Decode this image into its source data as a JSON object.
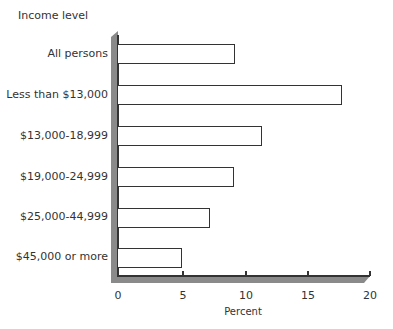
{
  "chart_data": {
    "type": "bar",
    "orientation": "horizontal",
    "title": "",
    "ylabel": "Income level",
    "xlabel": "Percent",
    "xlim": [
      0,
      20
    ],
    "xticks": [
      "0",
      "5",
      "10",
      "15",
      "20"
    ],
    "grid": false,
    "legend": null,
    "categories": [
      "All persons",
      "Less than $13,000",
      "$13,000-18,999",
      "$19,000-24,999",
      "$25,000-44,999",
      "$45,000 or more"
    ],
    "values": [
      9.3,
      17.8,
      11.4,
      9.2,
      7.3,
      5.1
    ]
  },
  "colors": {
    "bar_fill": "#ffffff",
    "bar_edge": "#333333",
    "axis_band": "#8a8a8a"
  }
}
